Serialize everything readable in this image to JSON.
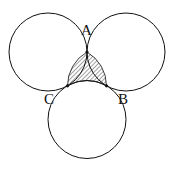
{
  "diagram": {
    "circles": [
      {
        "name": "top-left",
        "cx": 48,
        "cy": 52,
        "r": 39
      },
      {
        "name": "top-right",
        "cx": 126,
        "cy": 52,
        "r": 39
      },
      {
        "name": "bottom",
        "cx": 87,
        "cy": 119.5,
        "r": 39
      }
    ],
    "points": [
      {
        "label": "A",
        "x": 87,
        "y": 52,
        "label_x": 81,
        "label_y": 35
      },
      {
        "label": "B",
        "x": 106.5,
        "y": 85.8,
        "label_x": 118,
        "label_y": 104
      },
      {
        "label": "C",
        "x": 67.5,
        "y": 85.8,
        "label_x": 44,
        "label_y": 104
      }
    ],
    "shaded_region": "region bounded by arcs AB, BC, CA",
    "colors": {
      "stroke": "#111111",
      "hatch": "#111111",
      "background": "#ffffff"
    }
  }
}
